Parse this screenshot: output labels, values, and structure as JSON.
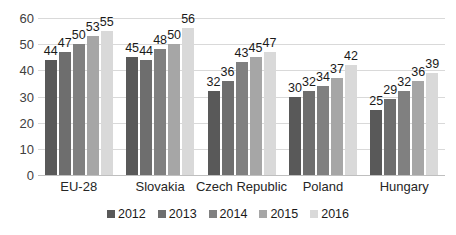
{
  "chart_data": {
    "type": "bar",
    "title": "",
    "subtitle": "",
    "xlabel": "",
    "ylabel": "",
    "ylim": [
      0,
      60
    ],
    "ytick_step": 10,
    "yticks": [
      0,
      10,
      20,
      30,
      40,
      50,
      60
    ],
    "grid": true,
    "legend_position": "bottom",
    "categories": [
      "EU-28",
      "Slovakia",
      "Czech Republic",
      "Poland",
      "Hungary"
    ],
    "series": [
      {
        "name": "2012",
        "color": "#595959",
        "values": [
          44,
          45,
          32,
          30,
          25
        ]
      },
      {
        "name": "2013",
        "color": "#6e6e6e",
        "values": [
          47,
          44,
          36,
          32,
          29
        ]
      },
      {
        "name": "2014",
        "color": "#808080",
        "values": [
          50,
          48,
          43,
          34,
          32
        ]
      },
      {
        "name": "2015",
        "color": "#a6a6a6",
        "values": [
          53,
          50,
          45,
          37,
          36
        ]
      },
      {
        "name": "2016",
        "color": "#d9d9d9",
        "values": [
          55,
          56,
          47,
          42,
          39
        ]
      }
    ],
    "data_labels": [
      [
        "44",
        "47",
        "50",
        "53",
        "55"
      ],
      [
        "45",
        "44",
        "48",
        "50",
        "56"
      ],
      [
        "32",
        "36",
        "43",
        "45",
        "47"
      ],
      [
        "30",
        "32",
        "34",
        "37",
        "42"
      ],
      [
        "25",
        "29",
        "32",
        "36",
        "39"
      ]
    ],
    "colors": {
      "gridline": "#d9d9d9",
      "axis_text": "#404040",
      "label_text": "#1a1a1a",
      "background": "#ffffff"
    }
  },
  "legend": {
    "items": [
      {
        "label": "2012"
      },
      {
        "label": "2013"
      },
      {
        "label": "2014"
      },
      {
        "label": "2015"
      },
      {
        "label": "2016"
      }
    ]
  }
}
